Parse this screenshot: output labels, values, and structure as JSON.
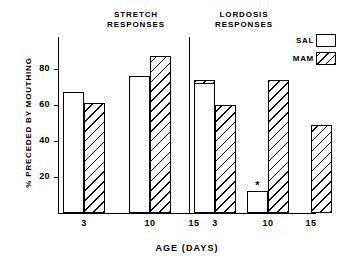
{
  "chart_data": {
    "type": "bar",
    "title": "",
    "xlabel": "AGE (DAYS)",
    "ylabel": "% PRECEDED BY MOUTHING",
    "ylim": [
      0,
      95
    ],
    "ytick_labels": [
      "20",
      "40",
      "60",
      "80"
    ],
    "ytick_values": [
      20,
      40,
      60,
      80
    ],
    "grid": false,
    "legend_position": "top-right",
    "panels": [
      {
        "name": "STRETCH\nRESPONSES",
        "categories": [
          "3",
          "10",
          "15"
        ],
        "series": [
          {
            "name": "SAL",
            "values": [
              67,
              76,
              null
            ]
          },
          {
            "name": "MAM",
            "values": [
              61,
              87,
              74
            ]
          }
        ]
      },
      {
        "name": "LORDOSIS\nRESPONSES",
        "categories": [
          "3",
          "10",
          "15"
        ],
        "series": [
          {
            "name": "SAL",
            "values": [
              72,
              12,
              null
            ]
          },
          {
            "name": "MAM",
            "values": [
              60,
              74,
              49
            ]
          }
        ]
      }
    ],
    "annotations": [
      {
        "text": "*",
        "panel": "LORDOSIS RESPONSES",
        "category": "10",
        "series": "SAL"
      }
    ],
    "legend": [
      {
        "label": "SAL",
        "swatch": "open"
      },
      {
        "label": "MAM",
        "swatch": "hatched"
      }
    ],
    "colors": {
      "ink": "#000000",
      "background": "#ffffff"
    }
  },
  "panels": {
    "stretch": {
      "title": "STRETCH\nRESPONSES"
    },
    "lordosis": {
      "title": "LORDOSIS\nRESPONSES"
    }
  },
  "axes": {
    "x_title": "AGE (DAYS)",
    "y_title": "% PRECEDED BY MOUTHING",
    "y_ticks": [
      "80",
      "60",
      "40",
      "20"
    ],
    "x_labels": [
      "3",
      "10",
      "15",
      "3",
      "10",
      "15"
    ]
  },
  "legend": {
    "sal_label": "SAL",
    "mam_label": "MAM"
  },
  "marks": {
    "asterisk": "*"
  }
}
